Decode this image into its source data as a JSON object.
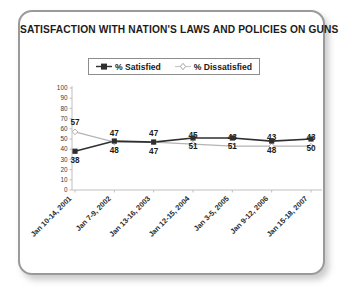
{
  "card": {
    "title": "SATISFACTION WITH NATION'S LAWS AND POLICIES ON GUNS"
  },
  "legend": {
    "items": [
      {
        "label": "% Satisfied",
        "marker": "filled-square-line-marker",
        "color": "#2f2f2f"
      },
      {
        "label": "% Dissatisfied",
        "marker": "open-diamond-marker",
        "color": "#b4b4b4"
      }
    ]
  },
  "axes": {
    "y_ticks": [
      "100",
      "90",
      "80",
      "70",
      "60",
      "50",
      "40",
      "30",
      "20",
      "10",
      "0"
    ],
    "x_categories": [
      "Jan 10-14, 2001",
      "Jan 7-9, 2002",
      "Jan 13-16, 2003",
      "Jan 12-15, 2004",
      "Jan 3-5, 2005",
      "Jan 9-12, 2006",
      "Jan 15-18, 2007"
    ]
  },
  "chart_data": {
    "type": "line",
    "title": "SATISFACTION WITH NATION'S LAWS AND POLICIES ON GUNS",
    "xlabel": "",
    "ylabel": "",
    "ylim": [
      0,
      100
    ],
    "ytick_step": 10,
    "grid": false,
    "legend_position": "top-center",
    "categories": [
      "Jan 10-14, 2001",
      "Jan 7-9, 2002",
      "Jan 13-16, 2003",
      "Jan 12-15, 2004",
      "Jan 3-5, 2005",
      "Jan 9-12, 2006",
      "Jan 15-18, 2007"
    ],
    "series": [
      {
        "name": "% Satisfied",
        "color": "#2f2f2f",
        "marker": "filled-square",
        "label_position": "below",
        "values": [
          38,
          48,
          47,
          51,
          51,
          48,
          50
        ]
      },
      {
        "name": "% Dissatisfied",
        "color": "#b4b4b4",
        "marker": "open-diamond",
        "label_position": "above",
        "values": [
          57,
          47,
          47,
          45,
          43,
          43,
          43
        ]
      }
    ]
  }
}
